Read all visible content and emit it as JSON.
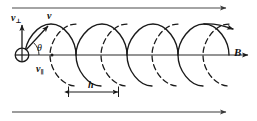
{
  "figure": {
    "width": 257,
    "height": 121,
    "background_color": "#ffffff",
    "stroke_color": "#1a1a1a",
    "rule_color": "#555555"
  },
  "labels": {
    "v_perp": {
      "symbol": "v",
      "subscript": "⊥",
      "text": "v⊥"
    },
    "v": {
      "symbol": "v",
      "subscript": "",
      "text": "v"
    },
    "v_parallel": {
      "symbol": "v",
      "subscript": "∥",
      "text": "v∥"
    },
    "theta": {
      "symbol": "θ",
      "text": "θ"
    },
    "B": {
      "symbol": "B",
      "text": "B"
    },
    "h": {
      "symbol": "h",
      "text": "h"
    }
  },
  "elements": {
    "origin_marker": {
      "name": "circled-plus",
      "glyph": "⊕",
      "x": 22,
      "y": 55,
      "radius": 7
    },
    "top_rule": {
      "x1": 12,
      "y1": 8,
      "x2": 228,
      "y2": 8,
      "arrowhead": "right"
    },
    "bottom_rule": {
      "x1": 12,
      "y1": 112,
      "x2": 228,
      "y2": 112,
      "arrowhead": "right"
    },
    "field_axis": {
      "x1": 22,
      "y1": 55,
      "x2": 252,
      "y2": 55,
      "arrowhead": "right"
    },
    "v_perp_arrow": {
      "x1": 22,
      "y1": 55,
      "x2": 22,
      "y2": 22,
      "arrowhead": "up"
    },
    "v_arrow": {
      "x1": 22,
      "y1": 55,
      "x2": 50,
      "y2": 24,
      "arrowhead": "up-right"
    },
    "theta_arc": {
      "center_x": 22,
      "center_y": 55,
      "radius": 16,
      "start_deg": 0,
      "end_deg": 48
    },
    "pitch_dimension": {
      "x1": 68,
      "y1": 92,
      "x2": 119,
      "y2": 92,
      "arrowhead": "both"
    },
    "helix": {
      "loops": 4,
      "pitch": 51,
      "start_x": 22,
      "axis_y": 55,
      "amplitude_y": 31,
      "loop_half_width": 27,
      "front_style": "solid",
      "back_style": "dashed",
      "terminal_arrowhead": "right"
    }
  }
}
